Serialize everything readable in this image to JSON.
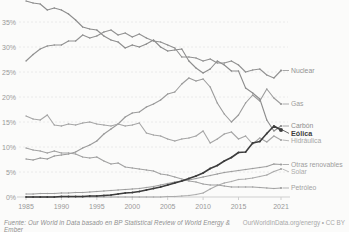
{
  "chart_data": {
    "type": "line",
    "title": "",
    "xlabel": "",
    "ylabel": "",
    "ylim": [
      0,
      39.5
    ],
    "grid": true,
    "legend_position": "right-end-labels",
    "yticks": [
      {
        "value": 0,
        "label": "0%"
      },
      {
        "value": 5,
        "label": "5%"
      },
      {
        "value": 10,
        "label": "10%"
      },
      {
        "value": 15,
        "label": "15%"
      },
      {
        "value": 20,
        "label": "20%"
      },
      {
        "value": 25,
        "label": "25%"
      },
      {
        "value": 30,
        "label": "30%"
      },
      {
        "value": 35,
        "label": "35%"
      }
    ],
    "xticks": [
      "1985",
      "1990",
      "1995",
      "2000",
      "2005",
      "2010",
      "2015",
      "2021"
    ],
    "x_start_year": 1985,
    "x_end_year": 2021,
    "x": [
      1985,
      1986,
      1987,
      1988,
      1989,
      1990,
      1991,
      1992,
      1993,
      1994,
      1995,
      1996,
      1997,
      1998,
      1999,
      2000,
      2001,
      2002,
      2003,
      2004,
      2005,
      2006,
      2007,
      2008,
      2009,
      2010,
      2011,
      2012,
      2013,
      2014,
      2015,
      2016,
      2017,
      2018,
      2019,
      2020,
      2021
    ],
    "series": [
      {
        "name": "Nuclear",
        "color": "#929292",
        "highlight": false,
        "values": [
          27.2,
          28.5,
          29.6,
          30.2,
          30.4,
          30.4,
          31.2,
          31.2,
          32.4,
          31.8,
          32.2,
          33.0,
          33.4,
          32.4,
          32.8,
          32.0,
          32.6,
          31.8,
          31.2,
          31.0,
          30.4,
          29.8,
          28.0,
          28.0,
          27.8,
          27.2,
          27.6,
          26.8,
          26.8,
          27.2,
          26.4,
          25.0,
          25.4,
          25.6,
          24.4,
          23.8,
          25.3
        ]
      },
      {
        "name": "Gas",
        "color": "#9b9b9b",
        "highlight": false,
        "values": [
          7.6,
          7.4,
          7.8,
          7.6,
          8.2,
          8.4,
          8.6,
          9.0,
          9.8,
          10.4,
          11.2,
          12.6,
          13.6,
          14.6,
          16.0,
          16.8,
          17.0,
          18.0,
          18.6,
          19.4,
          20.6,
          21.0,
          22.6,
          23.8,
          23.2,
          23.6,
          22.0,
          18.8,
          16.6,
          15.0,
          16.4,
          18.8,
          20.4,
          19.2,
          21.6,
          19.8,
          18.6
        ]
      },
      {
        "name": "Carbón",
        "color": "#8d8d8d",
        "highlight": false,
        "values": [
          39.2,
          38.8,
          38.6,
          37.4,
          37.8,
          37.4,
          36.6,
          35.4,
          34.0,
          33.6,
          33.4,
          32.2,
          31.4,
          31.0,
          29.8,
          30.4,
          30.0,
          30.6,
          31.4,
          30.0,
          29.2,
          29.4,
          29.6,
          27.2,
          25.8,
          24.8,
          25.6,
          27.2,
          26.4,
          25.2,
          25.2,
          21.8,
          20.8,
          19.6,
          15.4,
          13.2,
          14.2
        ]
      },
      {
        "name": "Eólica",
        "color": "#3d3d3d",
        "highlight": true,
        "values": [
          0.0,
          0.0,
          0.0,
          0.0,
          0.0,
          0.1,
          0.1,
          0.1,
          0.1,
          0.2,
          0.2,
          0.3,
          0.4,
          0.6,
          0.8,
          0.9,
          1.1,
          1.4,
          1.7,
          2.0,
          2.4,
          2.8,
          3.2,
          3.7,
          4.2,
          4.8,
          5.7,
          6.3,
          7.2,
          7.9,
          8.9,
          9.0,
          10.8,
          11.1,
          12.7,
          14.2,
          13.4
        ]
      },
      {
        "name": "Hidráulica",
        "color": "#a6a6a6",
        "highlight": false,
        "values": [
          16.2,
          15.6,
          15.4,
          16.4,
          14.4,
          14.2,
          14.6,
          14.4,
          14.8,
          15.0,
          14.6,
          14.4,
          14.2,
          14.6,
          14.2,
          14.4,
          14.8,
          12.8,
          12.4,
          12.2,
          11.6,
          11.2,
          11.6,
          11.8,
          12.2,
          13.2,
          10.8,
          11.6,
          12.6,
          13.0,
          11.6,
          12.2,
          10.6,
          11.8,
          11.0,
          12.2,
          11.4
        ]
      },
      {
        "name": "Otras renovables",
        "color": "#9d9d9d",
        "highlight": false,
        "values": [
          0.6,
          0.6,
          0.7,
          0.7,
          0.7,
          0.8,
          0.8,
          0.9,
          0.9,
          1.0,
          1.1,
          1.2,
          1.3,
          1.4,
          1.5,
          1.6,
          1.7,
          1.9,
          2.1,
          2.4,
          2.7,
          3.0,
          3.2,
          3.4,
          3.7,
          4.0,
          4.3,
          4.6,
          4.9,
          5.1,
          5.3,
          5.5,
          5.7,
          5.9,
          6.1,
          6.6,
          6.5
        ]
      },
      {
        "name": "Solar",
        "color": "#ababab",
        "highlight": false,
        "values": [
          0.0,
          0.0,
          0.0,
          0.0,
          0.0,
          0.0,
          0.0,
          0.0,
          0.0,
          0.0,
          0.0,
          0.0,
          0.0,
          0.0,
          0.0,
          0.0,
          0.0,
          0.0,
          0.0,
          0.0,
          0.1,
          0.1,
          0.2,
          0.3,
          0.5,
          0.8,
          1.6,
          2.3,
          2.8,
          3.1,
          3.5,
          3.6,
          3.8,
          4.1,
          4.4,
          5.1,
          5.6
        ]
      },
      {
        "name": "Petróleo",
        "color": "#a2a2a2",
        "highlight": false,
        "values": [
          9.8,
          9.4,
          9.2,
          8.8,
          9.2,
          8.8,
          8.8,
          8.6,
          8.0,
          7.8,
          8.0,
          7.2,
          6.6,
          6.8,
          6.0,
          5.8,
          5.6,
          5.4,
          5.2,
          4.6,
          4.4,
          4.0,
          3.6,
          3.2,
          3.0,
          2.6,
          2.4,
          2.4,
          2.2,
          2.0,
          2.0,
          2.0,
          2.0,
          1.9,
          1.8,
          1.7,
          1.8
        ]
      }
    ]
  },
  "footer": {
    "source": "Fuente: Our World in Data basado en BP Statistical Review of World Energy & Ember",
    "credit": "OurWorldInData.org/energy • CC BY"
  },
  "colors": {
    "background": "#fbfbfa",
    "axis_text": "#999999",
    "gridline": "#eaeaea",
    "zero_axis": "#cfcfcf",
    "highlight_series": "#3d3d3d",
    "muted_series": "#9a9a9a"
  }
}
